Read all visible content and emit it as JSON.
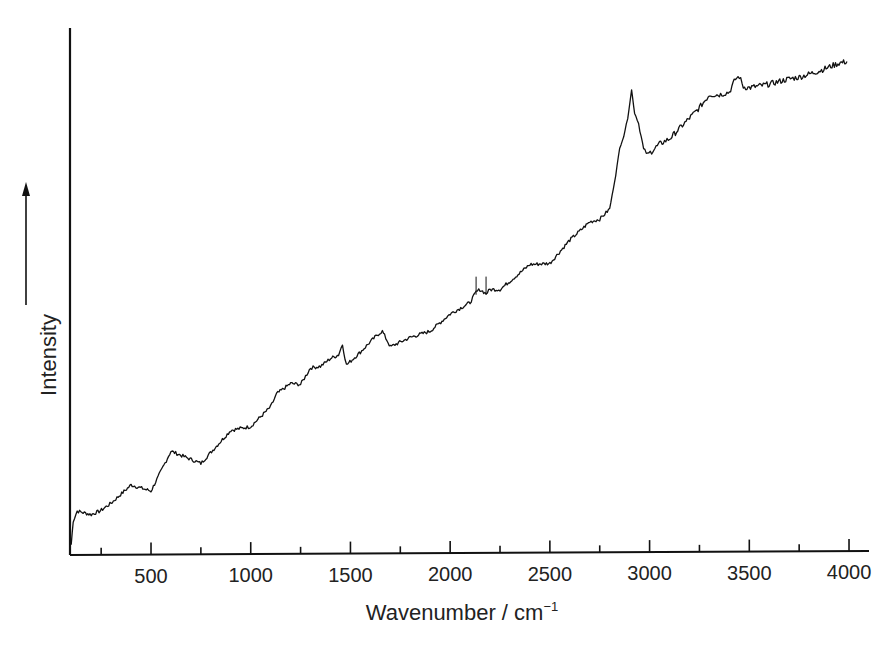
{
  "chart_data": {
    "type": "line",
    "title": "",
    "xlabel": "Wavenumber / cm⁻¹",
    "xlabel_base": "Wavenumber / cm",
    "xlabel_sup": "−1",
    "ylabel": "Intensity",
    "y_arrow": true,
    "xlim": [
      100,
      4100
    ],
    "ylim": [
      0,
      100
    ],
    "grid": false,
    "legend": null,
    "x_ticks_major": [
      500,
      1000,
      1500,
      2000,
      2500,
      3000,
      3500,
      4000
    ],
    "x_tick_labels": [
      "500",
      "1000",
      "1500",
      "2000",
      "2500",
      "3000",
      "3500",
      "4000"
    ],
    "x_ticks_minor": [
      250,
      750,
      1250,
      1750,
      2250,
      2750,
      3250,
      3750
    ],
    "y_ticks": [],
    "series": [
      {
        "name": "Raman spectrum",
        "color": "#111111",
        "x": [
          100,
          110,
          130,
          160,
          200,
          245,
          300,
          400,
          500,
          600,
          750,
          900,
          1000,
          1100,
          1130,
          1200,
          1250,
          1300,
          1350,
          1400,
          1440,
          1460,
          1480,
          1550,
          1600,
          1640,
          1660,
          1700,
          1800,
          1900,
          2000,
          2100,
          2130,
          2150,
          2180,
          2200,
          2250,
          2400,
          2500,
          2600,
          2700,
          2750,
          2800,
          2830,
          2850,
          2870,
          2890,
          2910,
          2925,
          2945,
          2970,
          2990,
          3010,
          3050,
          3100,
          3200,
          3250,
          3300,
          3350,
          3400,
          3430,
          3450,
          3470,
          3500,
          3600,
          3700,
          3750,
          3850,
          3950,
          3990
        ],
        "y": [
          2.0,
          6.6,
          8.5,
          8.2,
          7.8,
          8.5,
          10.0,
          13.5,
          12.3,
          20.0,
          17.6,
          24.0,
          24.7,
          28.5,
          31.0,
          33.0,
          32.8,
          36.0,
          36.3,
          37.8,
          38.5,
          40.5,
          36.5,
          39.0,
          41.0,
          42.5,
          43.0,
          40.0,
          41.8,
          43.0,
          46.3,
          48.5,
          50.5,
          51.0,
          50.2,
          51.0,
          51.0,
          55.8,
          56.0,
          60.5,
          64.0,
          64.5,
          66.5,
          73.0,
          78.2,
          80.5,
          84.0,
          89.5,
          85.0,
          83.0,
          78.0,
          77.0,
          77.6,
          79.0,
          80.0,
          84.0,
          86.0,
          88.5,
          88.5,
          89.0,
          91.5,
          92.0,
          90.0,
          89.8,
          90.5,
          91.5,
          91.8,
          93.0,
          94.5,
          94.8
        ]
      }
    ],
    "annotations": [
      {
        "x": 2910,
        "label": "strong peak (C–H stretch region)"
      },
      {
        "x": 3450,
        "label": "small peak"
      },
      {
        "x": 1640,
        "label": "small peak"
      },
      {
        "x": 1450,
        "label": "small peak"
      }
    ]
  },
  "layout": {
    "plot_left": 70,
    "plot_right": 868,
    "plot_top": 28,
    "plot_bottom": 555,
    "px_per_unit_x": 0.19943,
    "x_origin_px": 51.3
  }
}
